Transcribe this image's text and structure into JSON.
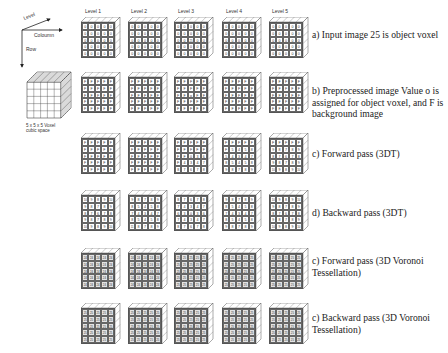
{
  "axes": {
    "level_label": "Level",
    "column_label": "Coloumn",
    "row_label": "Row"
  },
  "cube": {
    "caption": "5 x 5 x 5 Voxel cubic space"
  },
  "level_headers": [
    "Level 1",
    "Level 2",
    "Level 3",
    "Level 4",
    "Level 5"
  ],
  "rows": [
    {
      "caption": "a) Input image 25 is object voxel",
      "shaded": false,
      "blocks": [
        [
          [
            "0",
            "0",
            "0",
            "0",
            "0"
          ],
          [
            "0",
            "0",
            "0",
            "0",
            "0"
          ],
          [
            "0",
            "0",
            "0",
            "0",
            "0"
          ],
          [
            "0",
            "0",
            "0",
            "0",
            "0"
          ],
          [
            "0",
            "0",
            "0",
            "0",
            "0"
          ]
        ],
        [
          [
            "0",
            "0",
            "0",
            "0",
            "0"
          ],
          [
            "0",
            "0",
            "0",
            "0",
            "0"
          ],
          [
            "0",
            "0",
            "0",
            "0",
            "0"
          ],
          [
            "0",
            "0",
            "0",
            "0",
            "0"
          ],
          [
            "0",
            "0",
            "0",
            "0",
            "0"
          ]
        ],
        [
          [
            "0",
            "0",
            "0",
            "0",
            "0"
          ],
          [
            "0",
            "0",
            "0",
            "0",
            "0"
          ],
          [
            "0",
            "0",
            "25",
            "0",
            "0"
          ],
          [
            "0",
            "0",
            "0",
            "0",
            "0"
          ],
          [
            "0",
            "0",
            "0",
            "0",
            "0"
          ]
        ],
        [
          [
            "0",
            "0",
            "0",
            "0",
            "0"
          ],
          [
            "0",
            "0",
            "0",
            "0",
            "0"
          ],
          [
            "0",
            "0",
            "0",
            "0",
            "0"
          ],
          [
            "0",
            "0",
            "0",
            "0",
            "0"
          ],
          [
            "0",
            "0",
            "0",
            "0",
            "0"
          ]
        ],
        [
          [
            "0",
            "0",
            "0",
            "0",
            "0"
          ],
          [
            "0",
            "0",
            "0",
            "0",
            "0"
          ],
          [
            "0",
            "0",
            "0",
            "0",
            "0"
          ],
          [
            "0",
            "0",
            "0",
            "0",
            "0"
          ],
          [
            "0",
            "0",
            "0",
            "0",
            "0"
          ]
        ]
      ]
    },
    {
      "caption": "b) Preprocessed image Value o is assigned for object voxel, and F is background image",
      "shaded": false,
      "blocks": [
        [
          [
            "F",
            "F",
            "F",
            "F",
            "F"
          ],
          [
            "F",
            "F",
            "F",
            "F",
            "F"
          ],
          [
            "F",
            "F",
            "F",
            "F",
            "F"
          ],
          [
            "F",
            "F",
            "F",
            "F",
            "F"
          ],
          [
            "F",
            "F",
            "F",
            "F",
            "F"
          ]
        ],
        [
          [
            "F",
            "F",
            "F",
            "F",
            "F"
          ],
          [
            "F",
            "F",
            "F",
            "F",
            "F"
          ],
          [
            "F",
            "F",
            "F",
            "F",
            "F"
          ],
          [
            "F",
            "F",
            "F",
            "F",
            "F"
          ],
          [
            "F",
            "F",
            "F",
            "F",
            "F"
          ]
        ],
        [
          [
            "F",
            "F",
            "F",
            "F",
            "F"
          ],
          [
            "F",
            "F",
            "F",
            "F",
            "F"
          ],
          [
            "F",
            "F",
            "o",
            "F",
            "F"
          ],
          [
            "F",
            "F",
            "F",
            "F",
            "F"
          ],
          [
            "F",
            "F",
            "F",
            "F",
            "F"
          ]
        ],
        [
          [
            "F",
            "F",
            "F",
            "F",
            "F"
          ],
          [
            "F",
            "F",
            "F",
            "F",
            "F"
          ],
          [
            "F",
            "F",
            "F",
            "F",
            "F"
          ],
          [
            "F",
            "F",
            "F",
            "F",
            "F"
          ],
          [
            "F",
            "F",
            "F",
            "F",
            "F"
          ]
        ],
        [
          [
            "F",
            "F",
            "F",
            "F",
            "F"
          ],
          [
            "F",
            "F",
            "F",
            "F",
            "F"
          ],
          [
            "F",
            "F",
            "F",
            "F",
            "F"
          ],
          [
            "F",
            "F",
            "F",
            "F",
            "F"
          ],
          [
            "F",
            "F",
            "F",
            "F",
            "F"
          ]
        ]
      ]
    },
    {
      "caption": "c) Forward pass (3DT)",
      "shaded": false,
      "blocks": [
        [
          [
            "F",
            "F",
            "F",
            "F",
            "F"
          ],
          [
            "F",
            "F",
            "F",
            "F",
            "F"
          ],
          [
            "F",
            "F",
            "F",
            "F",
            "F"
          ],
          [
            "F",
            "F",
            "F",
            "F",
            "F"
          ],
          [
            "F",
            "F",
            "F",
            "F",
            "F"
          ]
        ],
        [
          [
            "F",
            "F",
            "F",
            "F",
            "F"
          ],
          [
            "F",
            "F",
            "F",
            "F",
            "F"
          ],
          [
            "F",
            "F",
            "F",
            "F",
            "F"
          ],
          [
            "F",
            "F",
            "F",
            "F",
            "F"
          ],
          [
            "F",
            "F",
            "F",
            "F",
            "F"
          ]
        ],
        [
          [
            "F",
            "F",
            "F",
            "F",
            "F"
          ],
          [
            "F",
            "F",
            "F",
            "F",
            "F"
          ],
          [
            "F",
            "F",
            "0",
            "3",
            "6"
          ],
          [
            "F",
            "4",
            "3",
            "4",
            "7"
          ],
          [
            "8",
            "7",
            "6",
            "7",
            "8"
          ]
        ],
        [
          [
            "F",
            "F",
            "F",
            "F",
            "F"
          ],
          [
            "F",
            "5",
            "4",
            "5",
            "8"
          ],
          [
            "5",
            "4",
            "3",
            "4",
            "7"
          ],
          [
            "8",
            "5",
            "4",
            "5",
            "8"
          ],
          [
            "9",
            "8",
            "7",
            "8",
            "9"
          ]
        ],
        [
          [
            "F",
            "F",
            "F",
            "F",
            "F"
          ],
          [
            "9",
            "8",
            "7",
            "8",
            "9"
          ],
          [
            "8",
            "7",
            "6",
            "7",
            "8"
          ],
          [
            "9",
            "8",
            "7",
            "8",
            "9"
          ],
          [
            "10",
            "9",
            "8",
            "9",
            "10"
          ]
        ]
      ]
    },
    {
      "caption": "d) Backward pass (3DT)",
      "shaded": false,
      "blocks": [
        [
          [
            "10",
            "9",
            "8",
            "9",
            "10"
          ],
          [
            "9",
            "8",
            "7",
            "8",
            "9"
          ],
          [
            "8",
            "7",
            "6",
            "7",
            "8"
          ],
          [
            "9",
            "8",
            "7",
            "8",
            "9"
          ],
          [
            "10",
            "9",
            "8",
            "9",
            "10"
          ]
        ],
        [
          [
            "9",
            "8",
            "7",
            "8",
            "9"
          ],
          [
            "8",
            "5",
            "4",
            "5",
            "8"
          ],
          [
            "7",
            "4",
            "3",
            "4",
            "7"
          ],
          [
            "8",
            "5",
            "4",
            "5",
            "8"
          ],
          [
            "11",
            "8",
            "7",
            "8",
            "9"
          ]
        ],
        [
          [
            "8",
            "7",
            "6",
            "7",
            "8"
          ],
          [
            "7",
            "4",
            "3",
            "4",
            "7"
          ],
          [
            "6",
            "3",
            "0",
            "3",
            "6"
          ],
          [
            "7",
            "4",
            "3",
            "4",
            "7"
          ],
          [
            "8",
            "7",
            "6",
            "7",
            "8"
          ]
        ],
        [
          [
            "9",
            "8",
            "7",
            "8",
            "9"
          ],
          [
            "8",
            "5",
            "4",
            "5",
            "8"
          ],
          [
            "7",
            "4",
            "3",
            "4",
            "7"
          ],
          [
            "8",
            "5",
            "4",
            "5",
            "8"
          ],
          [
            "9",
            "8",
            "7",
            "8",
            "9"
          ]
        ],
        [
          [
            "10",
            "9",
            "8",
            "9",
            "10"
          ],
          [
            "9",
            "8",
            "7",
            "8",
            "9"
          ],
          [
            "8",
            "7",
            "6",
            "7",
            "8"
          ],
          [
            "9",
            "8",
            "7",
            "8",
            "9"
          ],
          [
            "10",
            "9",
            "8",
            "9",
            "10"
          ]
        ]
      ]
    },
    {
      "caption": "c) Forward pass (3D Voronoi Tessellation)",
      "shaded": true,
      "blocks": [
        [
          [
            "24",
            "24",
            "24",
            "24",
            "24"
          ],
          [
            "24",
            "24",
            "24",
            "24",
            "24"
          ],
          [
            "24",
            "24",
            "24",
            "24",
            "24"
          ],
          [
            "24",
            "24",
            "24",
            "24",
            "24"
          ],
          [
            "24",
            "24",
            "24",
            "24",
            "24"
          ]
        ],
        [
          [
            "24",
            "24",
            "24",
            "24",
            "24"
          ],
          [
            "24",
            "24",
            "24",
            "24",
            "24"
          ],
          [
            "24",
            "24",
            "24",
            "24",
            "24"
          ],
          [
            "24",
            "24",
            "24",
            "24",
            "24"
          ],
          [
            "24",
            "24",
            "24",
            "24",
            "24"
          ]
        ],
        [
          [
            "25",
            "25",
            "25",
            "25",
            "25"
          ],
          [
            "25",
            "25",
            "25",
            "25",
            "25"
          ],
          [
            "25",
            "25",
            "25",
            "25",
            "25"
          ],
          [
            "25",
            "25",
            "25",
            "25",
            "25"
          ],
          [
            "25",
            "25",
            "25",
            "25",
            "25"
          ]
        ],
        [
          [
            "25",
            "25",
            "25",
            "25",
            "25"
          ],
          [
            "25",
            "25",
            "25",
            "25",
            "25"
          ],
          [
            "25",
            "25",
            "25",
            "25",
            "25"
          ],
          [
            "25",
            "25",
            "25",
            "25",
            "25"
          ],
          [
            "25",
            "25",
            "25",
            "25",
            "25"
          ]
        ],
        [
          [
            "25",
            "25",
            "25",
            "25",
            "25"
          ],
          [
            "25",
            "25",
            "25",
            "25",
            "25"
          ],
          [
            "25",
            "25",
            "25",
            "25",
            "25"
          ],
          [
            "25",
            "25",
            "25",
            "25",
            "25"
          ],
          [
            "25",
            "25",
            "25",
            "25",
            "25"
          ]
        ]
      ]
    },
    {
      "caption": "c) Backward pass (3D Voronoi Tessellation)",
      "shaded": true,
      "blocks": [
        [
          [
            "25",
            "25",
            "25",
            "25",
            "25"
          ],
          [
            "25",
            "25",
            "25",
            "25",
            "25"
          ],
          [
            "25",
            "25",
            "25",
            "25",
            "25"
          ],
          [
            "25",
            "25",
            "25",
            "25",
            "25"
          ],
          [
            "25",
            "25",
            "25",
            "25",
            "25"
          ]
        ],
        [
          [
            "25",
            "25",
            "25",
            "25",
            "25"
          ],
          [
            "25",
            "25",
            "25",
            "25",
            "25"
          ],
          [
            "25",
            "25",
            "25",
            "25",
            "25"
          ],
          [
            "25",
            "25",
            "25",
            "25",
            "25"
          ],
          [
            "25",
            "25",
            "25",
            "25",
            "25"
          ]
        ],
        [
          [
            "25",
            "25",
            "25",
            "25",
            "25"
          ],
          [
            "25",
            "25",
            "25",
            "25",
            "25"
          ],
          [
            "25",
            "25",
            "25",
            "25",
            "25"
          ],
          [
            "25",
            "25",
            "25",
            "25",
            "25"
          ],
          [
            "25",
            "25",
            "25",
            "25",
            "25"
          ]
        ],
        [
          [
            "25",
            "25",
            "25",
            "25",
            "25"
          ],
          [
            "25",
            "25",
            "25",
            "25",
            "25"
          ],
          [
            "25",
            "25",
            "25",
            "25",
            "25"
          ],
          [
            "25",
            "25",
            "25",
            "25",
            "25"
          ],
          [
            "25",
            "25",
            "25",
            "25",
            "25"
          ]
        ],
        [
          [
            "25",
            "25",
            "25",
            "25",
            "25"
          ],
          [
            "25",
            "25",
            "25",
            "25",
            "25"
          ],
          [
            "25",
            "25",
            "25",
            "25",
            "25"
          ],
          [
            "25",
            "25",
            "25",
            "25",
            "25"
          ],
          [
            "25",
            "25",
            "25",
            "25",
            "25"
          ]
        ]
      ]
    }
  ]
}
